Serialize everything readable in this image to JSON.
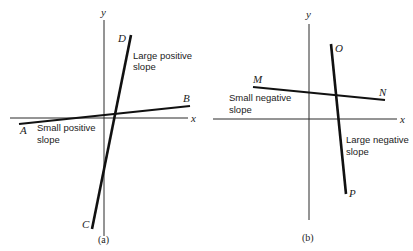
{
  "panels": [
    {
      "id": "a",
      "caption": "(a)",
      "axes": {
        "x_label": "x",
        "y_label": "y"
      },
      "lines": [
        {
          "name": "AB",
          "start_label": "A",
          "end_label": "B",
          "annotation_line1": "Small positive",
          "annotation_line2": "slope"
        },
        {
          "name": "CD",
          "start_label": "C",
          "end_label": "D",
          "annotation_line1": "Large positive",
          "annotation_line2": "slope"
        }
      ]
    },
    {
      "id": "b",
      "caption": "(b)",
      "axes": {
        "x_label": "x",
        "y_label": "y"
      },
      "lines": [
        {
          "name": "MN",
          "start_label": "M",
          "end_label": "N",
          "annotation_line1": "Small negative",
          "annotation_line2": "slope"
        },
        {
          "name": "OP",
          "start_label": "O",
          "end_label": "P",
          "annotation_line1": "Large negative",
          "annotation_line2": "slope"
        }
      ]
    }
  ],
  "colors": {
    "background": "#ffffff",
    "ink": "#111111"
  }
}
